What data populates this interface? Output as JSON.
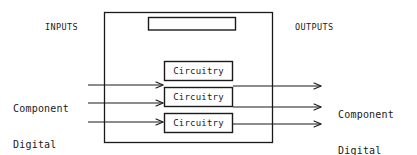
{
  "diagram": {
    "type": "block-diagram",
    "title": "",
    "background_color": "#ffffff",
    "line_color": "#1a1a1a",
    "text_color": "#1a1a1a",
    "section_labels": {
      "inputs": "INPUTS",
      "outputs": "OUTPUTS"
    },
    "io_labels": {
      "input_line1": "Component",
      "input_line2": "Digital",
      "input_full": "Component Digital",
      "output_line1": "Component",
      "output_line2": "Digital",
      "output_full": "Component Digital"
    },
    "outer_box": {
      "label": "",
      "x": 104,
      "y": 12,
      "width": 169,
      "height": 131
    },
    "top_box": {
      "label": "",
      "x": 148,
      "y": 17,
      "width": 88,
      "height": 13
    },
    "blocks": [
      {
        "label": "Circuitry",
        "x": 164,
        "y": 61,
        "width": 69,
        "height": 20
      },
      {
        "label": "Circuitry",
        "x": 164,
        "y": 87,
        "width": 69,
        "height": 20
      },
      {
        "label": "Circuitry",
        "x": 164,
        "y": 113,
        "width": 69,
        "height": 20
      }
    ],
    "input_arrows": [
      {
        "name": "input-arrow-1",
        "x1": 88,
        "y": 85,
        "x2": 164
      },
      {
        "name": "input-arrow-2",
        "x1": 88,
        "y": 103,
        "x2": 164
      },
      {
        "name": "input-arrow-3",
        "x1": 88,
        "y": 122,
        "x2": 164
      }
    ],
    "output_arrows": [
      {
        "name": "output-arrow-1",
        "x1": 233,
        "y": 86,
        "x2": 322
      },
      {
        "name": "output-arrow-2",
        "x1": 233,
        "y": 107,
        "x2": 322
      },
      {
        "name": "output-arrow-3",
        "x1": 233,
        "y": 124,
        "x2": 322
      }
    ]
  }
}
